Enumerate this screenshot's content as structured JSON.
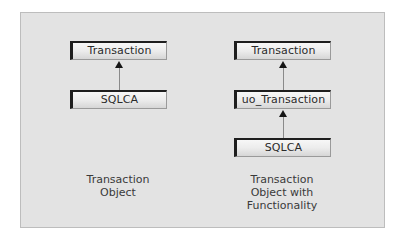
{
  "diagram": {
    "background_color": "#e3e3e3",
    "border_color": "#bdbdbd",
    "columns": [
      {
        "id": "left",
        "nodes": [
          {
            "label": "Transaction"
          },
          {
            "label": "SQLCA"
          }
        ],
        "edges": [
          {
            "from": "SQLCA",
            "to": "Transaction",
            "type": "inherits"
          }
        ],
        "caption": [
          "Transaction",
          "Object"
        ]
      },
      {
        "id": "right",
        "nodes": [
          {
            "label": "Transaction"
          },
          {
            "label": "uo_Transaction"
          },
          {
            "label": "SQLCA"
          }
        ],
        "edges": [
          {
            "from": "uo_Transaction",
            "to": "Transaction",
            "type": "inherits"
          },
          {
            "from": "SQLCA",
            "to": "uo_Transaction",
            "type": "inherits"
          }
        ],
        "caption": [
          "Transaction",
          "Object with",
          "Functionality"
        ]
      }
    ]
  }
}
